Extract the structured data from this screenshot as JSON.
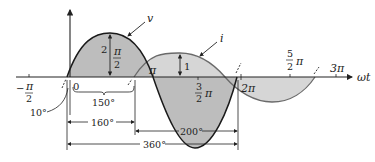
{
  "diagram": {
    "type": "phase-relationship-sinusoids",
    "axis_label": "ωt",
    "curves": [
      {
        "name": "v",
        "label": "v",
        "amplitude_mark": "2",
        "peak_label_num": "π",
        "peak_label_den": "2",
        "color": "#1a1a1a",
        "fill": "#b8b8b8"
      },
      {
        "name": "i",
        "label": "i",
        "amplitude_mark": "1",
        "color": "#6e6e6e",
        "fill": "#d4d4d4"
      }
    ],
    "ticks": {
      "neg_half_pi": {
        "sign": "−",
        "num": "π",
        "den": "2"
      },
      "zero": "0",
      "pi": "π",
      "three_half_pi": {
        "num": "3",
        "den": "2",
        "sym": "π"
      },
      "two_pi": "2π",
      "five_half_pi": {
        "num": "5",
        "den": "2",
        "sym": "π"
      },
      "three_pi": "3π"
    },
    "angle_annotations": {
      "lead_angle": "10°",
      "bracket_150": "150°",
      "dim_160": "160°",
      "dim_200": "200°",
      "dim_360": "360°"
    },
    "colors": {
      "axis": "#222222",
      "v_fill": "#b8b8b8",
      "i_fill": "#d4d4d4",
      "overlap_fill": "#a8a8a8"
    }
  }
}
